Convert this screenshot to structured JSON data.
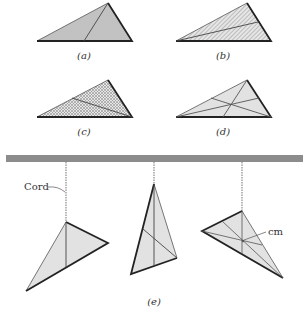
{
  "figure": {
    "panels": [
      {
        "id": "a",
        "label": "(a)",
        "description": "triangle with horizontal hatching and one line from apex to base"
      },
      {
        "id": "b",
        "label": "(b)",
        "description": "triangle with diagonal hatching and one line from left vertex to opposite side"
      },
      {
        "id": "c",
        "label": "(c)",
        "description": "triangle with cross hatching and one line from right vertex to opposite side"
      },
      {
        "id": "d",
        "label": "(d)",
        "description": "triangle with three medians intersecting at center of mass"
      },
      {
        "id": "e",
        "label": "(e)",
        "description": "three triangles hanging from cords attached to a horizontal bar"
      }
    ],
    "annotations": {
      "cord": "Cord",
      "cm": "cm"
    },
    "colors": {
      "fill": "#e2e2e2",
      "hatch": "#8a8a8a",
      "edge": "#222222",
      "bar": "#8c8c8c",
      "cord": "#9a9a9a"
    }
  }
}
